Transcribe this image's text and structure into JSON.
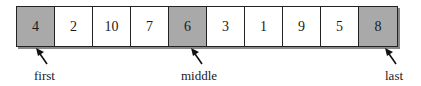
{
  "diagram": {
    "type": "array-quicksort-median-of-three",
    "cells": [
      {
        "value": "4",
        "shaded": true
      },
      {
        "value": "2",
        "shaded": false
      },
      {
        "value": "10",
        "shaded": false
      },
      {
        "value": "7",
        "shaded": false
      },
      {
        "value": "6",
        "shaded": true
      },
      {
        "value": "3",
        "shaded": false
      },
      {
        "value": "1",
        "shaded": false
      },
      {
        "value": "9",
        "shaded": false
      },
      {
        "value": "5",
        "shaded": false
      },
      {
        "value": "8",
        "shaded": true
      }
    ],
    "markers": [
      {
        "label": "first",
        "index": 0
      },
      {
        "label": "middle",
        "index": 4
      },
      {
        "label": "last",
        "index": 9
      }
    ],
    "colors": {
      "shaded": "#a9a9a9",
      "border": "#222222"
    }
  }
}
